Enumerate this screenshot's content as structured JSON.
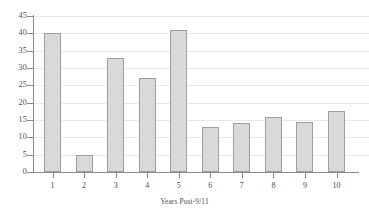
{
  "chart_data": {
    "type": "bar",
    "title": "",
    "xlabel": "Years Post-9/11",
    "ylabel": "",
    "categories": [
      "1",
      "2",
      "3",
      "4",
      "5",
      "6",
      "7",
      "8",
      "9",
      "10"
    ],
    "values": [
      40,
      5,
      33,
      27,
      41,
      13,
      14,
      16,
      14.5,
      17.5
    ],
    "ylim": [
      0,
      45
    ],
    "ytick_labels": [
      "0",
      "5",
      "10",
      "15",
      "20",
      "25",
      "30",
      "35",
      "40",
      "45"
    ],
    "ytick_values": [
      0,
      5,
      10,
      15,
      20,
      25,
      30,
      35,
      40,
      45
    ],
    "grid": true,
    "grid_axis": "y",
    "legend": false,
    "legend_position": "none",
    "colors": {
      "bar_fill": "#d9d9d9",
      "bar_border": "#9e9e9e",
      "axis": "#8a8a8a",
      "gridline": "#e9e9e9",
      "text": "#4e4e4e",
      "background": "#ffffff"
    }
  }
}
